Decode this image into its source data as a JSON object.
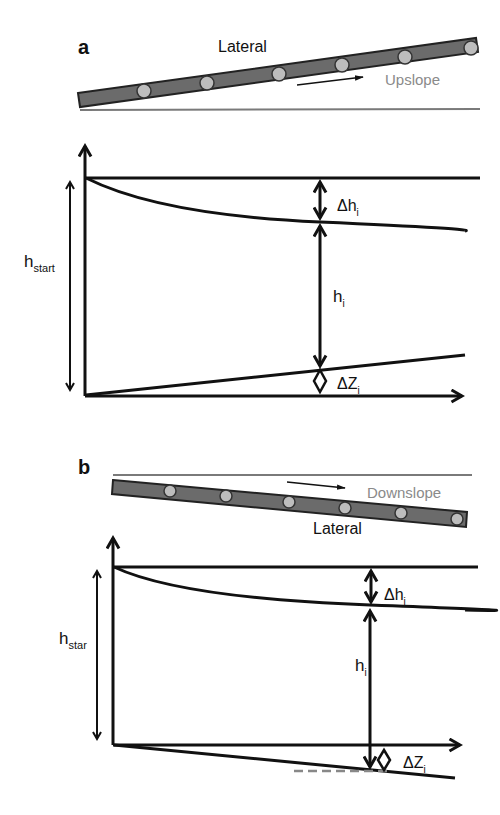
{
  "panels": [
    {
      "id": "a",
      "label": "a",
      "lateral_label": "Lateral",
      "slope_label": "Upslope",
      "slope_direction": "up",
      "h_start_label": "h",
      "h_start_sub": "start",
      "delta_h_label": "Δh",
      "delta_h_sub": "i",
      "h_label": "h",
      "h_sub": "i",
      "delta_z_label": "ΔZ",
      "delta_z_sub": "i"
    },
    {
      "id": "b",
      "label": "b",
      "lateral_label": "Lateral",
      "slope_label": "Downslope",
      "slope_direction": "down",
      "h_start_label": "h",
      "h_start_sub": "star",
      "delta_h_label": "Δh",
      "delta_h_sub": "i",
      "h_label": "h",
      "h_sub": "i",
      "delta_z_label": "ΔZ",
      "delta_z_sub": "i"
    }
  ],
  "colors": {
    "pipe": "#6b6b6b",
    "emitter": "#bdbdbd",
    "ground": "#7a7a7a",
    "slope_text": "#8a8a8a",
    "line": "#111111"
  }
}
